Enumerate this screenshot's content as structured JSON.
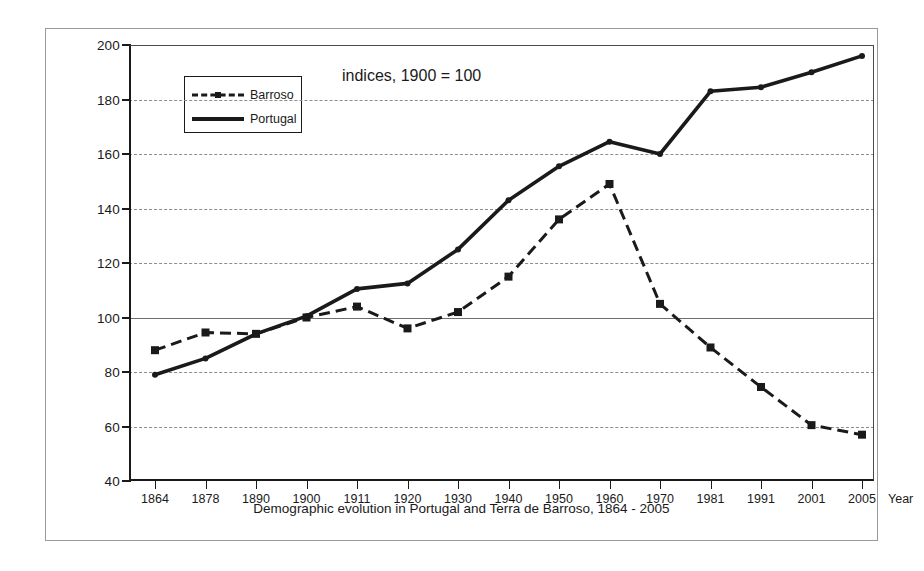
{
  "chart_data": {
    "type": "line",
    "title": "",
    "annotation": "indices, 1900 = 100",
    "caption": "Demographic evolution in Portugal and Terra de Barroso, 1864 - 2005",
    "xlabel": "Year",
    "ylabel": "",
    "categories": [
      "1864",
      "1878",
      "1890",
      "1900",
      "1911",
      "1920",
      "1930",
      "1940",
      "1950",
      "1960",
      "1970",
      "1981",
      "1991",
      "2001",
      "2005"
    ],
    "xtick_labels": [
      "1864",
      "1878",
      "1890",
      "1900",
      "1911",
      "1920",
      "1930",
      "1940",
      "1950",
      "1960",
      "1970",
      "1981",
      "1991",
      "2001",
      "2005"
    ],
    "ytick_labels": [
      "200",
      "180",
      "160",
      "140",
      "120",
      "100",
      "80",
      "60",
      "40"
    ],
    "ytick_values": [
      200,
      180,
      160,
      140,
      120,
      100,
      80,
      60,
      40
    ],
    "ylim": [
      40,
      200
    ],
    "grid": true,
    "grid_axis": "y",
    "legend_position": "upper-left-inside",
    "series": [
      {
        "name": "Barroso",
        "style": "dashed",
        "marker": "square",
        "color": "#1a1a1a",
        "values": [
          88,
          94.5,
          94,
          100,
          104,
          96,
          102,
          115,
          136,
          149,
          105,
          89,
          74.5,
          60.5,
          57
        ]
      },
      {
        "name": "Portugal",
        "style": "solid",
        "marker": "dot",
        "color": "#1a1a1a",
        "values": [
          79,
          85,
          94,
          100.5,
          110.5,
          112.5,
          125,
          143,
          155.5,
          164.5,
          160,
          183,
          184.5,
          190,
          196
        ]
      }
    ]
  },
  "legend": {
    "items": [
      {
        "label": "Barroso"
      },
      {
        "label": "Portugal"
      }
    ]
  }
}
